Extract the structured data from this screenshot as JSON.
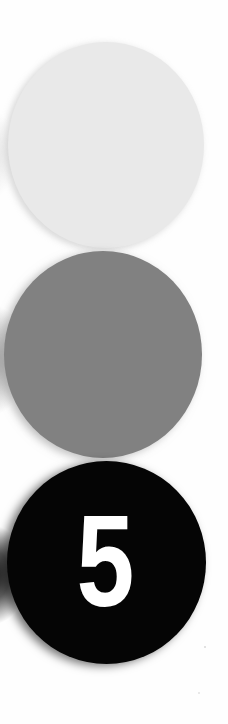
{
  "page": {
    "background_color": "#fefefe",
    "width": 228,
    "height": 724
  },
  "markers": [
    {
      "id": "circle-light",
      "shape": "circle",
      "fill_color": "#e9e9e9",
      "label": "",
      "label_color": "",
      "order": 1
    },
    {
      "id": "circle-mid",
      "shape": "circle",
      "fill_color": "#818181",
      "label": "",
      "label_color": "",
      "order": 2
    },
    {
      "id": "circle-dark",
      "shape": "circle",
      "fill_color": "#050505",
      "label": "5",
      "label_color": "#ffffff",
      "order": 3
    }
  ]
}
